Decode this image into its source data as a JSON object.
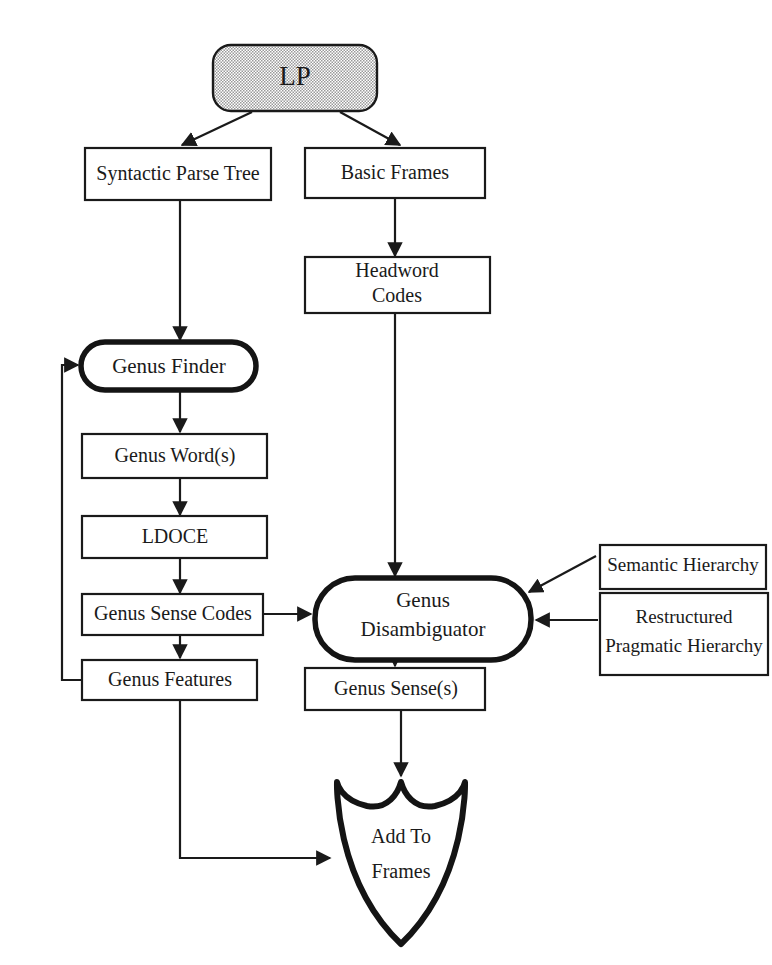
{
  "diagram": {
    "colors": {
      "ink": "#1a1a1a",
      "paper": "#ffffff",
      "lp_fill": "#c9c9c9"
    },
    "nodes": {
      "lp": {
        "label": "LP",
        "shape": "rounded-filled"
      },
      "syntactic_parse": {
        "label": "Syntactic Parse Tree",
        "shape": "rect"
      },
      "basic_frames": {
        "label": "Basic Frames",
        "shape": "rect"
      },
      "headword_codes": {
        "line1": "Headword",
        "line2": "Codes",
        "shape": "rect"
      },
      "genus_finder": {
        "label": "Genus  Finder",
        "shape": "rounded-bold"
      },
      "genus_words": {
        "label": "Genus  Word(s)",
        "shape": "rect"
      },
      "ldoce": {
        "label": "LDOCE",
        "shape": "rect"
      },
      "genus_sense_codes": {
        "label": "Genus Sense Codes",
        "shape": "rect"
      },
      "genus_features": {
        "label": "Genus  Features",
        "shape": "rect"
      },
      "genus_disambiguator": {
        "line1": "Genus",
        "line2": "Disambiguator",
        "shape": "rounded-bold"
      },
      "semantic_hierarchy": {
        "label": "Semantic Hierarchy",
        "shape": "rect"
      },
      "pragmatic_hierarchy": {
        "line1": "Restructured",
        "line2": "Pragmatic Hierarchy",
        "shape": "rect"
      },
      "genus_senses": {
        "label": "Genus Sense(s)",
        "shape": "rect"
      },
      "add_to_frames": {
        "line1": "Add To",
        "line2": "Frames",
        "shape": "shield"
      }
    }
  }
}
